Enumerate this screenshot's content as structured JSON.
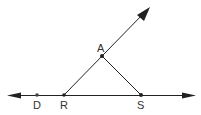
{
  "diagram": {
    "type": "geometry",
    "colors": {
      "stroke": "#222222",
      "label": "#333333",
      "background": "#ffffff"
    },
    "points": [
      {
        "id": "D",
        "label": "D",
        "x": 37,
        "y": 95
      },
      {
        "id": "R",
        "label": "R",
        "x": 64,
        "y": 95
      },
      {
        "id": "A",
        "label": "A",
        "x": 102,
        "y": 56
      },
      {
        "id": "S",
        "label": "S",
        "x": 141,
        "y": 95
      }
    ],
    "lines": [
      {
        "id": "line-DS",
        "type": "line",
        "through": [
          "D",
          "R",
          "S"
        ],
        "arrows": "both"
      },
      {
        "id": "ray-RA",
        "type": "ray",
        "from": "R",
        "through": "A",
        "arrows": "end"
      },
      {
        "id": "segment-AS",
        "type": "segment",
        "from": "A",
        "to": "S"
      }
    ]
  }
}
